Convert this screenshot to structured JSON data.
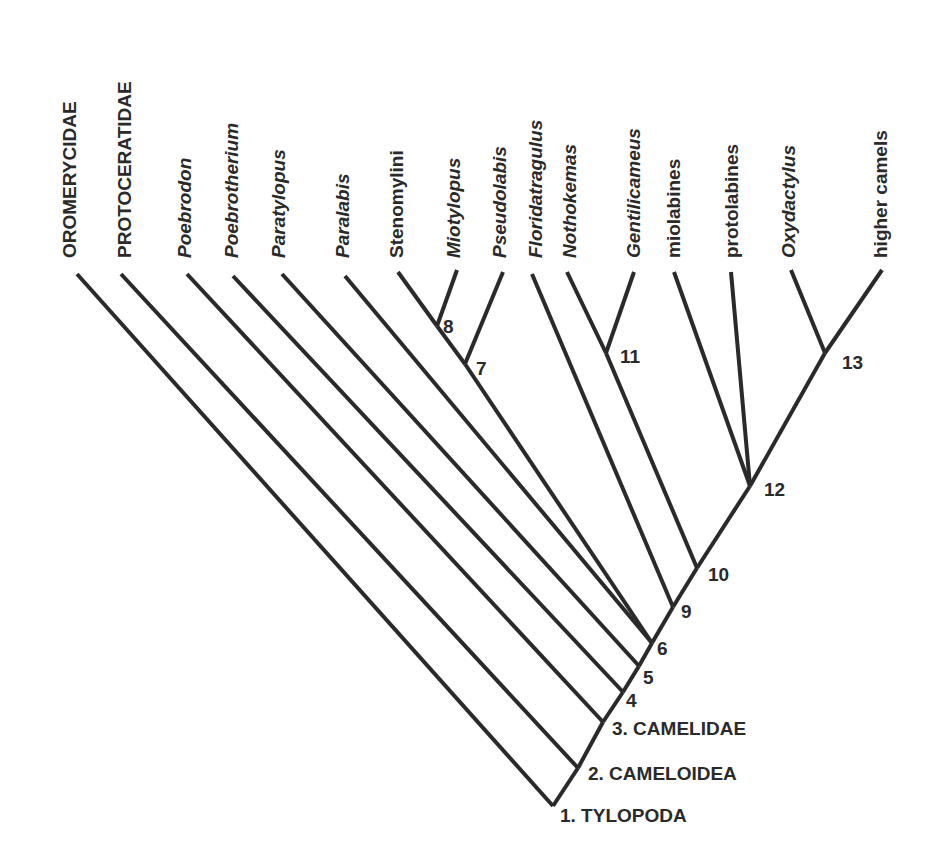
{
  "diagram": {
    "type": "cladogram",
    "taxa": [
      {
        "id": "oromerycidae",
        "label": "OROMERYCIDAE",
        "italic": false,
        "tip": [
          77,
          274
        ],
        "attach": [
          553,
          806
        ],
        "text_x": 76
      },
      {
        "id": "protoceratidae",
        "label": "PROTOCERATIDAE",
        "italic": false,
        "tip": [
          121,
          274
        ],
        "attach": [
          578,
          768
        ],
        "text_x": 131
      },
      {
        "id": "poebrodon",
        "label": "Poebrodon",
        "italic": true,
        "tip": [
          187,
          274
        ],
        "attach": [
          603,
          722
        ],
        "text_x": 191
      },
      {
        "id": "poebrotherium",
        "label": "Poebrotherium",
        "italic": true,
        "tip": [
          233,
          276
        ],
        "attach": [
          623,
          692
        ],
        "text_x": 238
      },
      {
        "id": "paratylopus",
        "label": "Paratylopus",
        "italic": true,
        "tip": [
          282,
          274
        ],
        "attach": [
          639,
          666
        ],
        "text_x": 285
      },
      {
        "id": "paralabis",
        "label": "Paralabis",
        "italic": true,
        "tip": [
          345,
          276
        ],
        "attach": [
          652,
          643
        ],
        "text_x": 349
      },
      {
        "id": "stenomylini",
        "label": "Stenomylini",
        "italic": false,
        "tip": [
          398,
          272
        ],
        "attach": [
          437,
          326
        ],
        "text_x": 403
      },
      {
        "id": "miotylopus",
        "label": "Miotylopus",
        "italic": true,
        "tip": [
          457,
          270
        ],
        "attach": [
          437,
          326
        ],
        "text_x": 460
      },
      {
        "id": "pseudolabis",
        "label": "Pseudolabis",
        "italic": true,
        "tip": [
          503,
          272
        ],
        "attach": [
          465,
          364
        ],
        "text_x": 506
      },
      {
        "id": "floridatragulus",
        "label": "Floridatragulus",
        "italic": true,
        "tip": [
          532,
          274
        ],
        "attach": [
          673,
          607
        ],
        "text_x": 542
      },
      {
        "id": "nothokemas",
        "label": "Nothokemas",
        "italic": true,
        "tip": [
          567,
          272
        ],
        "attach": [
          606,
          353
        ],
        "text_x": 576
      },
      {
        "id": "gentilicameus",
        "label": "Gentilicameus",
        "italic": true,
        "tip": [
          634,
          272
        ],
        "attach": [
          606,
          353
        ],
        "text_x": 640
      },
      {
        "id": "miolabines",
        "label": "miolabines",
        "italic": false,
        "tip": [
          674,
          272
        ],
        "attach": [
          750,
          486
        ],
        "text_x": 680
      },
      {
        "id": "protolabines",
        "label": "protolabines",
        "italic": false,
        "tip": [
          731,
          272
        ],
        "attach": [
          750,
          486
        ],
        "text_x": 738
      },
      {
        "id": "oxydactylus",
        "label": "Oxydactylus",
        "italic": true,
        "tip": [
          791,
          270
        ],
        "attach": [
          825,
          353
        ],
        "text_x": 795
      },
      {
        "id": "higher_camels",
        "label": "higher camels",
        "italic": false,
        "tip": [
          882,
          270
        ],
        "attach": [
          825,
          353
        ],
        "text_x": 887
      }
    ],
    "internal_edges": [
      {
        "from": [
          437,
          326
        ],
        "to": [
          465,
          364
        ]
      },
      {
        "from": [
          465,
          364
        ],
        "to": [
          652,
          643
        ]
      },
      {
        "from": [
          606,
          353
        ],
        "to": [
          697,
          568
        ]
      },
      {
        "from": [
          825,
          353
        ],
        "to": [
          750,
          486
        ]
      },
      {
        "from": [
          750,
          486
        ],
        "to": [
          697,
          568
        ]
      },
      {
        "from": [
          697,
          568
        ],
        "to": [
          673,
          607
        ]
      },
      {
        "from": [
          673,
          607
        ],
        "to": [
          652,
          643
        ]
      },
      {
        "from": [
          652,
          643
        ],
        "to": [
          639,
          666
        ]
      },
      {
        "from": [
          639,
          666
        ],
        "to": [
          623,
          692
        ]
      },
      {
        "from": [
          623,
          692
        ],
        "to": [
          603,
          722
        ]
      },
      {
        "from": [
          603,
          722
        ],
        "to": [
          578,
          768
        ]
      },
      {
        "from": [
          578,
          768
        ],
        "to": [
          553,
          806
        ]
      }
    ],
    "nodes": [
      {
        "number": "1",
        "label": "1. TYLOPODA",
        "pos": [
          553,
          806
        ],
        "text": [
          560,
          822
        ]
      },
      {
        "number": "2",
        "label": "2. CAMELOIDEA",
        "pos": [
          578,
          768
        ],
        "text": [
          588,
          780
        ]
      },
      {
        "number": "3",
        "label": "3. CAMELIDAE",
        "pos": [
          603,
          722
        ],
        "text": [
          612,
          735
        ]
      },
      {
        "number": "4",
        "label": "4",
        "pos": [
          623,
          692
        ],
        "text": [
          626,
          707
        ]
      },
      {
        "number": "5",
        "label": "5",
        "pos": [
          639,
          666
        ],
        "text": [
          643,
          684
        ]
      },
      {
        "number": "6",
        "label": "6",
        "pos": [
          652,
          643
        ],
        "text": [
          657,
          655
        ]
      },
      {
        "number": "7",
        "label": "7",
        "pos": [
          465,
          364
        ],
        "text": [
          476,
          375
        ]
      },
      {
        "number": "8",
        "label": "8",
        "pos": [
          437,
          326
        ],
        "text": [
          443,
          333
        ]
      },
      {
        "number": "9",
        "label": "9",
        "pos": [
          673,
          607
        ],
        "text": [
          681,
          618
        ]
      },
      {
        "number": "10",
        "label": "10",
        "pos": [
          697,
          568
        ],
        "text": [
          708,
          581
        ]
      },
      {
        "number": "11",
        "label": "11",
        "pos": [
          606,
          353
        ],
        "text": [
          620,
          363
        ]
      },
      {
        "number": "12",
        "label": "12",
        "pos": [
          750,
          486
        ],
        "text": [
          764,
          496
        ]
      },
      {
        "number": "13",
        "label": "13",
        "pos": [
          825,
          353
        ],
        "text": [
          842,
          369
        ]
      }
    ],
    "colors": {
      "line": "#2a2a2a",
      "text": "#2a2a2a",
      "background": "#ffffff"
    }
  }
}
